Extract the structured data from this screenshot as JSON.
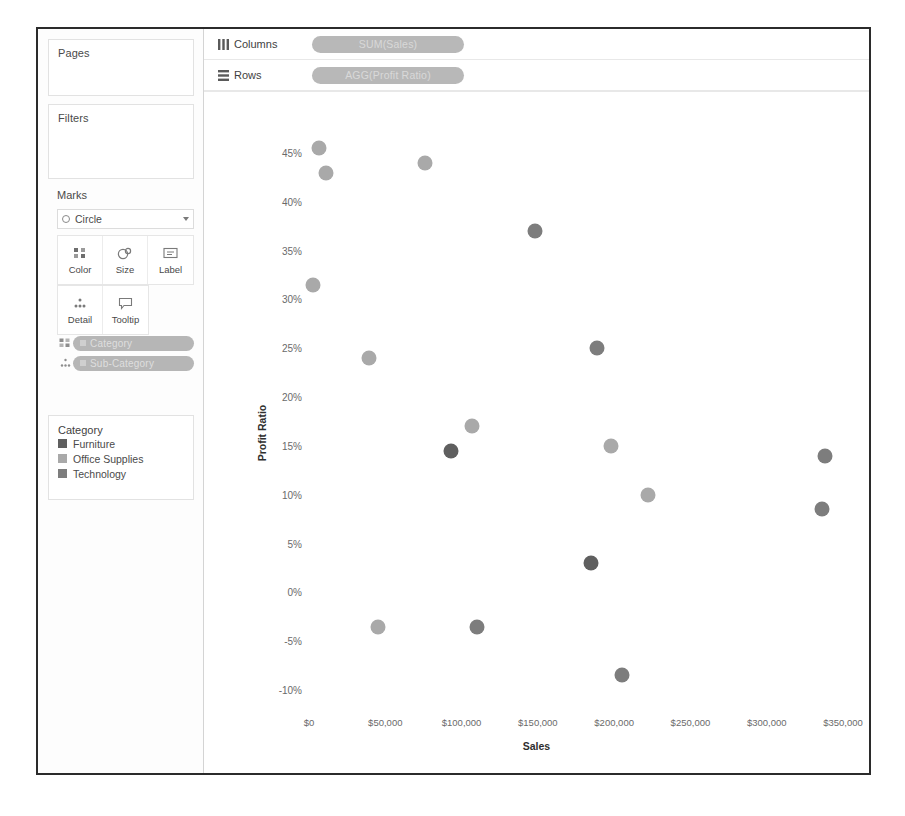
{
  "window": {
    "title": ""
  },
  "shelves": {
    "columns": {
      "label": "Columns",
      "icon": "columns-icon",
      "pill": "SUM(Sales)"
    },
    "rows": {
      "label": "Rows",
      "icon": "rows-icon",
      "pill": "AGG(Profit Ratio)"
    }
  },
  "left_panel": {
    "pages": {
      "title": "Pages"
    },
    "filters": {
      "title": "Filters"
    },
    "marks": {
      "title": "Marks",
      "mark_type": "Circle",
      "buttons": [
        {
          "label": "Color",
          "icon": "color-icon"
        },
        {
          "label": "Size",
          "icon": "size-icon"
        },
        {
          "label": "Label",
          "icon": "label-icon"
        },
        {
          "label": "Detail",
          "icon": "detail-icon"
        },
        {
          "label": "Tooltip",
          "icon": "tooltip-icon"
        }
      ],
      "pills": [
        {
          "label": "Category",
          "icon": "color-icon"
        },
        {
          "label": "Sub-Category",
          "icon": "detail-icon"
        }
      ]
    },
    "legend": {
      "title": "Category",
      "items": [
        {
          "label": "Furniture",
          "color": "#5f5f5f"
        },
        {
          "label": "Office Supplies",
          "color": "#a9a9a9"
        },
        {
          "label": "Technology",
          "color": "#7d7d7d"
        }
      ]
    }
  },
  "chart_data": {
    "type": "scatter",
    "title": "",
    "xlabel": "Sales",
    "ylabel": "Profit Ratio",
    "xlim": [
      -55000,
      385000
    ],
    "ylim": [
      -13,
      48
    ],
    "grid": false,
    "legend_position": "left-panel",
    "xticks": [
      {
        "value": 0,
        "label": "$0"
      },
      {
        "value": 50000,
        "label": "$50,000"
      },
      {
        "value": 100000,
        "label": "$100,000"
      },
      {
        "value": 150000,
        "label": "$150,000"
      },
      {
        "value": 200000,
        "label": "$200,000"
      },
      {
        "value": 250000,
        "label": "$250,000"
      },
      {
        "value": 300000,
        "label": "$300,000"
      },
      {
        "value": 350000,
        "label": "$350,000"
      }
    ],
    "yticks": [
      {
        "value": 45,
        "label": "45%"
      },
      {
        "value": 40,
        "label": "40%"
      },
      {
        "value": 35,
        "label": "35%"
      },
      {
        "value": 30,
        "label": "30%"
      },
      {
        "value": 25,
        "label": "25%"
      },
      {
        "value": 20,
        "label": "20%"
      },
      {
        "value": 15,
        "label": "15%"
      },
      {
        "value": 10,
        "label": "10%"
      },
      {
        "value": 5,
        "label": "5%"
      },
      {
        "value": 0,
        "label": "0%"
      },
      {
        "value": -5,
        "label": "-5%"
      },
      {
        "value": -10,
        "label": "-10%"
      }
    ],
    "series": [
      {
        "name": "Furniture",
        "color": "#5f5f5f"
      },
      {
        "name": "Office Supplies",
        "color": "#a9a9a9"
      },
      {
        "name": "Technology",
        "color": "#7d7d7d"
      }
    ],
    "points": [
      {
        "x": 6500,
        "y": 45.5,
        "series": "Office Supplies",
        "size": 15
      },
      {
        "x": 11000,
        "y": 43.0,
        "series": "Office Supplies",
        "size": 15
      },
      {
        "x": 76000,
        "y": 44.0,
        "series": "Office Supplies",
        "size": 15
      },
      {
        "x": 148000,
        "y": 37.0,
        "series": "Technology",
        "size": 15
      },
      {
        "x": 2500,
        "y": 31.5,
        "series": "Office Supplies",
        "size": 15
      },
      {
        "x": 189000,
        "y": 25.0,
        "series": "Technology",
        "size": 15
      },
      {
        "x": 39000,
        "y": 24.0,
        "series": "Office Supplies",
        "size": 15
      },
      {
        "x": 107000,
        "y": 17.0,
        "series": "Office Supplies",
        "size": 15
      },
      {
        "x": 93000,
        "y": 14.5,
        "series": "Furniture",
        "size": 15
      },
      {
        "x": 338000,
        "y": 14.0,
        "series": "Technology",
        "size": 15
      },
      {
        "x": 198000,
        "y": 15.0,
        "series": "Office Supplies",
        "size": 15
      },
      {
        "x": 222000,
        "y": 10.0,
        "series": "Office Supplies",
        "size": 15
      },
      {
        "x": 336000,
        "y": 8.5,
        "series": "Technology",
        "size": 15
      },
      {
        "x": 185000,
        "y": 3.0,
        "series": "Furniture",
        "size": 15
      },
      {
        "x": 45000,
        "y": -3.5,
        "series": "Office Supplies",
        "size": 15
      },
      {
        "x": 110000,
        "y": -3.5,
        "series": "Technology",
        "size": 15
      },
      {
        "x": 205000,
        "y": -8.5,
        "series": "Technology",
        "size": 15
      }
    ]
  }
}
